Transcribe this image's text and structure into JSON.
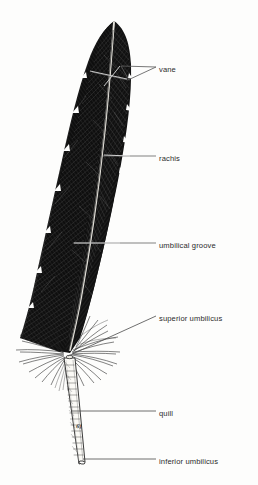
{
  "figure": {
    "style": "black-and-white engraving / line illustration",
    "background_color": "#fdfdfc",
    "ink_color": "#1a1a1a",
    "leader_line_color": "#555555",
    "label_text_color": "#2b2b2b",
    "artist_mark": "61"
  },
  "labels": [
    {
      "id": "vane",
      "text": "vane",
      "text_x": 159,
      "text_y": 69,
      "leader": "forked",
      "leader_color": "#606060"
    },
    {
      "id": "rachis",
      "text": "rachis",
      "text_x": 159,
      "text_y": 158,
      "leader": "straight",
      "leader_color": "#606060"
    },
    {
      "id": "umbilical-groove",
      "text": "umbilical groove",
      "text_x": 159,
      "text_y": 245,
      "leader": "straight",
      "leader_color": "#606060"
    },
    {
      "id": "superior-umbilicus",
      "text": "superior umbilicus",
      "text_x": 159,
      "text_y": 318,
      "leader": "diagonal",
      "leader_color": "#4a4a4a"
    },
    {
      "id": "quill",
      "text": "quill",
      "text_x": 159,
      "text_y": 413,
      "leader": "straight",
      "leader_color": "#4a4a4a"
    },
    {
      "id": "inferior-umbilicus",
      "text": "inferior umbilicus",
      "text_x": 159,
      "text_y": 461,
      "leader": "straight",
      "leader_color": "#4a4a4a"
    }
  ],
  "parts": {
    "vane": "broad flattened barb surface on both sides of the rachis",
    "rachis": "central shaft running the length of the vane",
    "umbilical_groove": "groove along the ventral side of the rachis",
    "superior_umbilicus": "opening at the junction of rachis and calamus",
    "quill": "hollow tapering calamus at the base",
    "inferior_umbilicus": "opening at the very bottom tip of the quill"
  }
}
